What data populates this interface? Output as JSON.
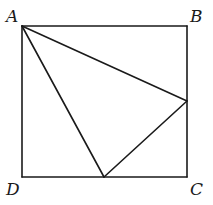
{
  "diagram": {
    "type": "geometry",
    "stroke_color": "#1a1a1a",
    "background": "#ffffff",
    "points": {
      "A": {
        "x": 22,
        "y": 26,
        "label": "A"
      },
      "B": {
        "x": 187,
        "y": 26,
        "label": "B"
      },
      "C": {
        "x": 187,
        "y": 177,
        "label": "C"
      },
      "D": {
        "x": 22,
        "y": 177,
        "label": "D"
      },
      "E": {
        "x": 187,
        "y": 101
      },
      "F": {
        "x": 104,
        "y": 177
      }
    },
    "labels": {
      "A": "A",
      "B": "B",
      "C": "C",
      "D": "D"
    },
    "segments": [
      [
        "A",
        "B"
      ],
      [
        "B",
        "C"
      ],
      [
        "C",
        "D"
      ],
      [
        "D",
        "A"
      ],
      [
        "A",
        "E"
      ],
      [
        "A",
        "F"
      ],
      [
        "E",
        "F"
      ]
    ]
  }
}
